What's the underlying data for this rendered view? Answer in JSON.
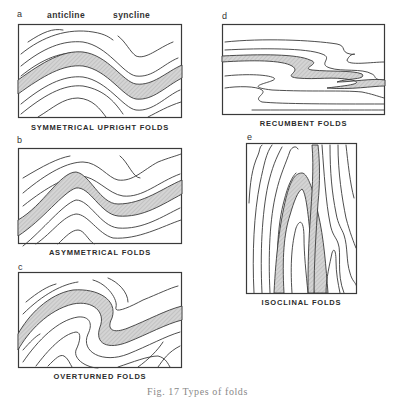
{
  "figure": {
    "caption": "Fig. 17   Types of folds",
    "panels": [
      {
        "letter": "a",
        "title": "SYMMETRICAL UPRIGHT FOLDS",
        "labels": [
          "anticline",
          "syncline"
        ]
      },
      {
        "letter": "b",
        "title": "ASYMMETRICAL FOLDS"
      },
      {
        "letter": "c",
        "title": "OVERTURNED FOLDS"
      },
      {
        "letter": "d",
        "title": "RECUMBENT FOLDS"
      },
      {
        "letter": "e",
        "title": "ISOCLINAL FOLDS"
      }
    ],
    "colors": {
      "line": "#3a3a3a",
      "shaded_bed": "#c8c8c8",
      "background": "#ffffff"
    }
  }
}
